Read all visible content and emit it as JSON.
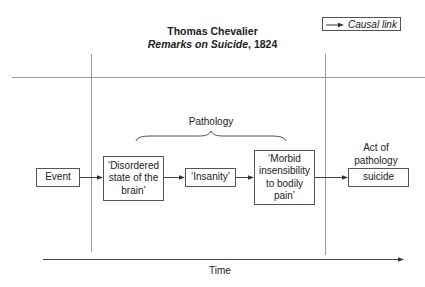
{
  "header": {
    "title": "Thomas Chevalier",
    "subtitle_italic": "Remarks on Suicide",
    "subtitle_rest": ", 1824"
  },
  "legend": {
    "label": "Causal link",
    "icon": "arrow-right-icon"
  },
  "sections": {
    "pathology_label": "Pathology",
    "act_label_line1": "Act of",
    "act_label_line2": "pathology"
  },
  "nodes": [
    {
      "id": "event",
      "label": "Event"
    },
    {
      "id": "disordered",
      "line1": "‘Disordered",
      "line2": "state of the",
      "line3": "brain’"
    },
    {
      "id": "insanity",
      "label": "‘Insanity’"
    },
    {
      "id": "morbid",
      "line1": "‘Morbid",
      "line2": "insensibility",
      "line3": "to bodily",
      "line4": "pain’"
    },
    {
      "id": "suicide",
      "label": "suicide"
    }
  ],
  "edges": [
    {
      "from": "event",
      "to": "disordered"
    },
    {
      "from": "disordered",
      "to": "insanity"
    },
    {
      "from": "insanity",
      "to": "morbid"
    },
    {
      "from": "morbid",
      "to": "suicide"
    }
  ],
  "axis": {
    "label": "Time"
  },
  "colors": {
    "line": "#555555",
    "divider": "#999999",
    "text": "#222222"
  }
}
